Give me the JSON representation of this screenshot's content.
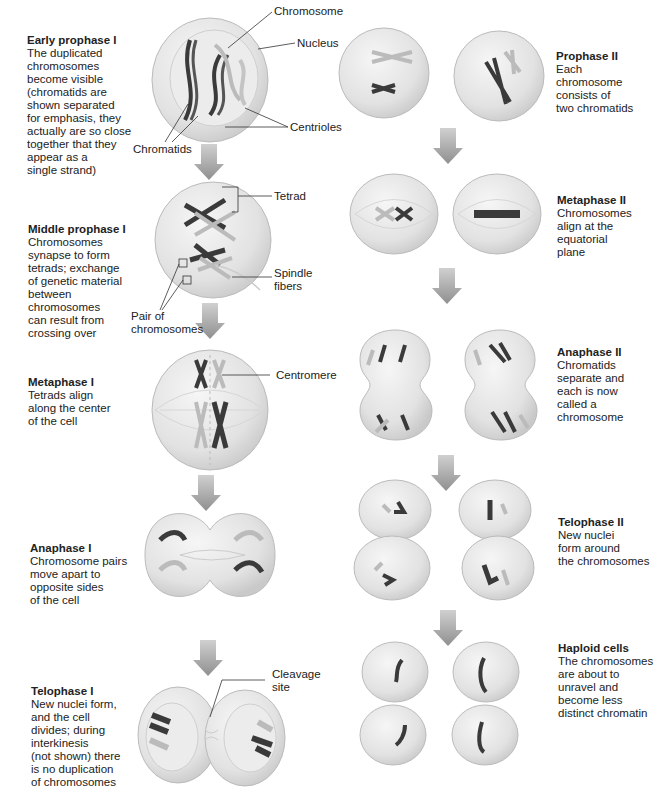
{
  "title_fragment": "",
  "meiosis_I": [
    {
      "title": "Early prophase I",
      "body": "The duplicated\nchromosomes\nbecome visible\n(chromatids are\nshown separated\nfor emphasis, they\nactually are so close\ntogether that they\nappear as a\nsingle strand)"
    },
    {
      "title": "Middle prophase I",
      "body": "Chromosomes\nsynapse to form\ntetrads; exchange\nof genetic material\nbetween\nchromosomes\ncan result from\ncrossing over"
    },
    {
      "title": "Metaphase I",
      "body": "Tetrads align\nalong the center\nof the cell"
    },
    {
      "title": "Anaphase I",
      "body": "Chromosome pairs\nmove apart to\nopposite sides\nof the cell"
    },
    {
      "title": "Telophase I",
      "body": "New nuclei form,\nand the cell\ndivides; during\ninterkinesis\n(not shown) there\nis no duplication\nof chromosomes"
    }
  ],
  "meiosis_II": [
    {
      "title": "Prophase II",
      "body": "Each\nchromosome\nconsists of\ntwo chromatids"
    },
    {
      "title": "Metaphase II",
      "body": "Chromosomes\nalign at the\nequatorial\nplane"
    },
    {
      "title": "Anaphase II",
      "body": "Chromatids\nseparate and\neach is now\ncalled a\nchromosome"
    },
    {
      "title": "Telophase II",
      "body": "New nuclei\nform around\nthe chromosomes"
    },
    {
      "title": "Haploid cells",
      "body": "The chromosomes\nare about to\nunravel and\nbecome less\ndistinct chromatin"
    }
  ],
  "labels": {
    "chromosome": "Chromosome",
    "nucleus": "Nucleus",
    "centrioles": "Centrioles",
    "chromatids": "Chromatids",
    "tetrad": "Tetrad",
    "spindle_fibers": "Spindle\nfibers",
    "pair_of_chromosomes": "Pair of\nchromosomes",
    "centromere": "Centromere",
    "cleavage_site": "Cleavage\nsite"
  },
  "colors": {
    "cell_fill": "#e6e6e6",
    "cell_edge": "#b9b9b9",
    "nucleus_fill": "#eeeeee",
    "chromosome_dark": "#3a3a3a",
    "chromosome_light": "#b5b5b5",
    "arrow": "#9a9a9a"
  }
}
